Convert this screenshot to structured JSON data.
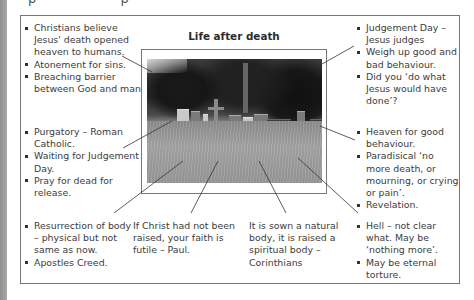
{
  "page": {
    "top_cut_text": "p p"
  },
  "diagram": {
    "title": "Life after death",
    "image": {
      "description": "black-and-white photograph of an overgrown graveyard with headstones and trees"
    },
    "blocks": {
      "top_left": {
        "items": [
          "Christians believe Jesus' death opened heaven to humans.",
          "Atonement for sins.",
          "Breaching barrier between God and man."
        ]
      },
      "middle_left": {
        "items": [
          "Purgatory – Roman Catholic.",
          "Waiting for Judgement Day.",
          "Pray for dead for release."
        ]
      },
      "bottom_left": {
        "items": [
          "Resurrection of body – physical but not same as now.",
          "Apostles Creed."
        ]
      },
      "bottom_middle_left": {
        "text": "If Christ had not been raised, your faith is futile – Paul."
      },
      "bottom_middle_right": {
        "text": "It is sown a natural body, it is raised a spiritual body – Corinthians"
      },
      "top_right": {
        "items": [
          "Judgement Day – Jesus judges",
          "Weigh up good and bad behaviour.",
          "Did you ‘do what Jesus would have done’?"
        ]
      },
      "middle_right": {
        "items": [
          "Heaven for good behaviour.",
          "Paradisical ‘no more death, or mourning, or crying or pain’.",
          "Revelation."
        ]
      },
      "bottom_right": {
        "items": [
          "Hell – not clear what. May be ‘nothing more’.",
          "May be eternal torture."
        ]
      }
    },
    "colors": {
      "border": "#777777",
      "text": "#3c3c3c",
      "leader_line": "#333333",
      "side_strip": "#9a9a9a"
    }
  }
}
